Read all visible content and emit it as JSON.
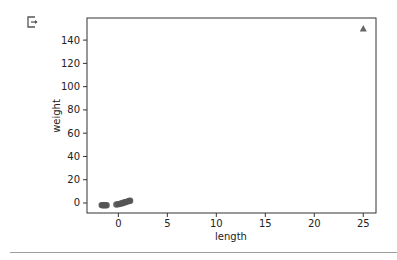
{
  "cell": {
    "output_icon": "output-exit-icon"
  },
  "chart_data": {
    "type": "scatter",
    "title": "",
    "xlabel": "length",
    "ylabel": "weight",
    "xlim": [
      -3.2,
      26.3
    ],
    "ylim": [
      -8.6,
      159
    ],
    "xticks": [
      0,
      5,
      10,
      15,
      20,
      25
    ],
    "yticks": [
      0,
      20,
      40,
      60,
      80,
      100,
      120,
      140
    ],
    "grid": false,
    "series": [
      {
        "name": "samples",
        "marker": "circle",
        "color": "#555555",
        "points": [
          [
            -1.7,
            -1.8
          ],
          [
            -1.6,
            -1.9
          ],
          [
            -1.5,
            -1.8
          ],
          [
            -1.4,
            -1.9
          ],
          [
            -1.3,
            -1.8
          ],
          [
            -1.2,
            -1.9
          ],
          [
            -0.2,
            -1.3
          ],
          [
            0.0,
            -1.0
          ],
          [
            0.2,
            -0.6
          ],
          [
            0.4,
            -0.2
          ],
          [
            0.5,
            0.2
          ],
          [
            0.7,
            0.6
          ],
          [
            0.8,
            1.0
          ],
          [
            1.0,
            1.4
          ],
          [
            1.1,
            1.8
          ],
          [
            1.2,
            2.0
          ]
        ]
      },
      {
        "name": "outlier",
        "marker": "triangle",
        "color": "#666666",
        "points": [
          [
            25,
            150
          ]
        ]
      }
    ]
  }
}
